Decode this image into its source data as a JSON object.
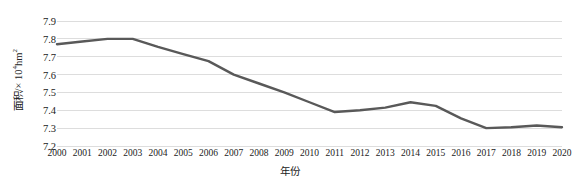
{
  "chart_data": {
    "type": "line",
    "title": "",
    "xlabel": "年份",
    "ylabel": "面积/×10⁴hm²",
    "ylabel_parts": {
      "prefix": "面积/× 10",
      "exponent": "4",
      "suffix": "hm",
      "unit_exponent": "2"
    },
    "categories": [
      "2000",
      "2001",
      "2002",
      "2003",
      "2004",
      "2005",
      "2006",
      "2007",
      "2008",
      "2009",
      "2010",
      "2011",
      "2012",
      "2013",
      "2014",
      "2015",
      "2016",
      "2017",
      "2018",
      "2019",
      "2020"
    ],
    "values": [
      7.77,
      7.785,
      7.8,
      7.8,
      7.755,
      7.715,
      7.675,
      7.6,
      7.55,
      7.5,
      7.445,
      7.39,
      7.4,
      7.415,
      7.445,
      7.425,
      7.355,
      7.3,
      7.305,
      7.315,
      7.305
    ],
    "series": [
      {
        "name": "面积",
        "color": "#595959",
        "values": [
          7.77,
          7.785,
          7.8,
          7.8,
          7.755,
          7.715,
          7.675,
          7.6,
          7.55,
          7.5,
          7.445,
          7.39,
          7.4,
          7.415,
          7.445,
          7.425,
          7.355,
          7.3,
          7.305,
          7.315,
          7.305
        ]
      }
    ],
    "ylim": [
      7.2,
      7.9
    ],
    "y_ticks": [
      7.9,
      7.8,
      7.7,
      7.6,
      7.5,
      7.4,
      7.3,
      7.2
    ],
    "y_tick_labels": [
      "7.9",
      "7.8",
      "7.7",
      "7.6",
      "7.5",
      "7.4",
      "7.3",
      "7.2"
    ],
    "grid": true,
    "grid_axis": "y",
    "gridline_color": "#d4d4d4",
    "legend": false,
    "legend_position": "none",
    "markers": false,
    "line_width": 2.4,
    "background": "#ffffff",
    "text_color": "#222222"
  }
}
